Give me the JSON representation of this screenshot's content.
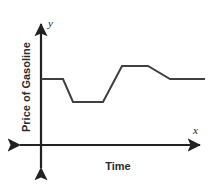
{
  "figure": {
    "background_color": "#ffffff",
    "width": 216,
    "height": 184
  },
  "chart_data": {
    "type": "line",
    "title": "",
    "subtitle": "",
    "xlabel": "Time",
    "ylabel": "Price of Gasoline",
    "x_axis_symbol": "x",
    "y_axis_symbol": "y",
    "grid": false,
    "legend": null,
    "xticks": [],
    "yticks": [],
    "xlim": [
      0,
      216
    ],
    "ylim": [
      0,
      184
    ],
    "axes": {
      "origin_x": 41,
      "origin_y": 145,
      "x_axis_left_end": 14,
      "x_axis_right_end": 206,
      "y_axis_top_end": 18,
      "y_axis_bottom_end": 174,
      "arrowheads": [
        "x-positive",
        "x-negative",
        "y-positive",
        "y-negative"
      ],
      "color": "#222222",
      "line_width": 2
    },
    "series": [
      {
        "name": "Price of Gasoline over Time",
        "color": "#3f3f3f",
        "line_width": 2,
        "description": "Piecewise constant-and-sloped curve: steady, drops to a low plateau, rises to a high plateau, declines gently, then steady.",
        "points": [
          {
            "x": 41,
            "y": 79,
            "segment": "initial steady level"
          },
          {
            "x": 63,
            "y": 79,
            "segment": "start of decrease"
          },
          {
            "x": 73,
            "y": 102,
            "segment": "bottom of decrease"
          },
          {
            "x": 103,
            "y": 102,
            "segment": "low steady plateau end"
          },
          {
            "x": 122,
            "y": 66,
            "segment": "top of sharp increase"
          },
          {
            "x": 148,
            "y": 66,
            "segment": "high steady plateau end"
          },
          {
            "x": 170,
            "y": 79,
            "segment": "end of gentle decline"
          },
          {
            "x": 205,
            "y": 79,
            "segment": "final steady level"
          }
        ]
      }
    ],
    "annotations": []
  },
  "labels": {
    "y_axis_title": "Price of Gasoline",
    "x_axis_title": "Time",
    "x_symbol": "x",
    "y_symbol": "y"
  }
}
